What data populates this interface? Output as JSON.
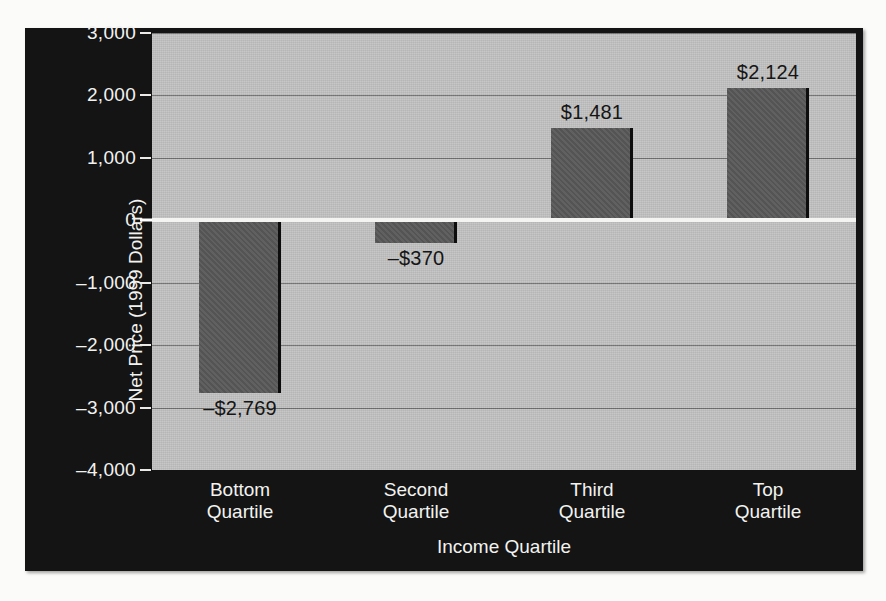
{
  "chart_data": {
    "type": "bar",
    "title": "",
    "xlabel": "Income Quartile",
    "ylabel": "Net Price (1999 Dollars)",
    "categories": [
      "Bottom Quartile",
      "Second Quartile",
      "Third Quartile",
      "Top Quartile"
    ],
    "category_lines": [
      [
        "Bottom",
        "Quartile"
      ],
      [
        "Second",
        "Quartile"
      ],
      [
        "Third",
        "Quartile"
      ],
      [
        "Top",
        "Quartile"
      ]
    ],
    "values": [
      -2769,
      -370,
      1481,
      2124
    ],
    "value_labels": [
      "–$2,769",
      "–$370",
      "$1,481",
      "$2,124"
    ],
    "ylim": [
      -4000,
      3000
    ],
    "ytick_values": [
      3000,
      2000,
      1000,
      0,
      -1000,
      -2000,
      -3000,
      -4000
    ],
    "ytick_labels": [
      "3,000",
      "2,000",
      "1,000",
      "0",
      "–1,000",
      "–2,000",
      "–3,000",
      "–4,000"
    ],
    "grid": true,
    "legend": "none",
    "colors": {
      "panel_background": "#141414",
      "plot_background": "#c2c2c2",
      "bar_fill": "#585858",
      "bar_edge": "#0d0d0d",
      "gridline": "#6f6f6f",
      "zero_line": "#f4f4f2",
      "axis_text": "#f2f2f0",
      "value_label_text": "#151515"
    }
  }
}
